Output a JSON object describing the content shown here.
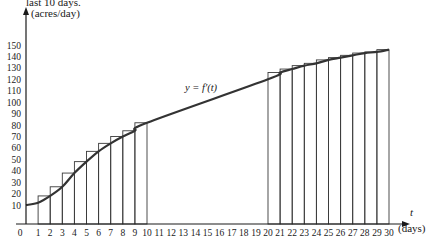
{
  "caption_fragment": "last 10 days.",
  "chart_data": {
    "type": "bar",
    "title": "",
    "xlabel": "t (days)",
    "ylabel": "(acres/day)",
    "x_axis_symbol": "t",
    "x_axis_unit": "(days)",
    "xlim": [
      0,
      30
    ],
    "ylim": [
      0,
      150
    ],
    "x_ticks": [
      0,
      1,
      2,
      3,
      4,
      5,
      6,
      7,
      8,
      9,
      10,
      11,
      12,
      13,
      14,
      15,
      16,
      17,
      18,
      19,
      20,
      21,
      22,
      23,
      24,
      25,
      26,
      27,
      28,
      29,
      30
    ],
    "y_ticks": [
      10,
      20,
      30,
      40,
      50,
      60,
      70,
      80,
      90,
      100,
      110,
      120,
      130,
      140,
      150
    ],
    "grid": false,
    "curve": {
      "label": "y = f′(t)",
      "points": [
        [
          0,
          10
        ],
        [
          1,
          12
        ],
        [
          2,
          18
        ],
        [
          3,
          26
        ],
        [
          4,
          38
        ],
        [
          5,
          48
        ],
        [
          6,
          57
        ],
        [
          7,
          64
        ],
        [
          8,
          70
        ],
        [
          9,
          75
        ],
        [
          10,
          82
        ],
        [
          20,
          120
        ],
        [
          21,
          126
        ],
        [
          22,
          129
        ],
        [
          23,
          132
        ],
        [
          24,
          134
        ],
        [
          25,
          137
        ],
        [
          26,
          139
        ],
        [
          27,
          141
        ],
        [
          28,
          143
        ],
        [
          29,
          144
        ],
        [
          30,
          146
        ]
      ]
    },
    "series": [
      {
        "name": "Rectangles (right endpoints), t = 1 to 10",
        "x_start": [
          1,
          2,
          3,
          4,
          5,
          6,
          7,
          8,
          9
        ],
        "x_end": [
          2,
          3,
          4,
          5,
          6,
          7,
          8,
          9,
          10
        ],
        "values": [
          18,
          26,
          38,
          48,
          57,
          64,
          70,
          75,
          82
        ]
      },
      {
        "name": "Rectangles (right endpoints), t = 20 to 30",
        "x_start": [
          20,
          21,
          22,
          23,
          24,
          25,
          26,
          27,
          28,
          29
        ],
        "x_end": [
          21,
          22,
          23,
          24,
          25,
          26,
          27,
          28,
          29,
          30
        ],
        "values": [
          126,
          129,
          132,
          134,
          137,
          139,
          141,
          143,
          144,
          146
        ]
      }
    ]
  }
}
